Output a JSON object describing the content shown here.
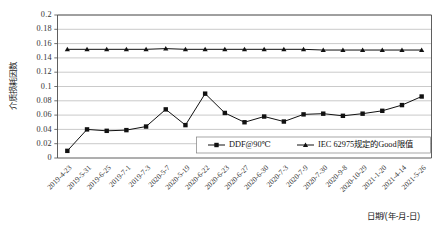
{
  "chart_data": {
    "type": "line",
    "title": "",
    "xlabel": "日期/(年-月-日)",
    "ylabel": "介质损耗因数",
    "ylim": [
      0,
      0.2
    ],
    "ytick_step": 0.02,
    "grid": true,
    "legend_position": "inside-bottom-right",
    "ytick_labels": [
      "0",
      "0.02",
      "0.04",
      "0.06",
      "0.08",
      "0.1",
      "0.12",
      "0.14",
      "0.16",
      "0.18",
      "0.2"
    ],
    "ytick_values": [
      0,
      0.02,
      0.04,
      0.06,
      0.08,
      0.1,
      0.12,
      0.14,
      0.16,
      0.18,
      0.2
    ],
    "categories": [
      "2019-4-23",
      "2019-5-31",
      "2019-6-25",
      "2019-7-1",
      "2019-7-3",
      "2020-5-7",
      "2020-5-19",
      "2020-6-22",
      "2020-6-23",
      "2020-6-27",
      "2020-6-30",
      "2020-7-3",
      "2020-7-9",
      "2020-7-30",
      "2020-9-8",
      "2020-10-29",
      "2021-1-20",
      "2021-4-14",
      "2021-5-26"
    ],
    "series": [
      {
        "name": "DDF@90℃",
        "marker": "square",
        "color": "#111111",
        "values": [
          0.01,
          0.04,
          0.038,
          0.039,
          0.044,
          0.068,
          0.046,
          0.09,
          0.063,
          0.05,
          0.058,
          0.051,
          0.061,
          0.062,
          0.059,
          0.062,
          0.066,
          0.074,
          0.086
        ]
      },
      {
        "name": "IEC 62975规定的Good限值",
        "marker": "triangle",
        "color": "#111111",
        "values": [
          0.152,
          0.152,
          0.152,
          0.152,
          0.152,
          0.153,
          0.152,
          0.152,
          0.152,
          0.152,
          0.152,
          0.152,
          0.152,
          0.151,
          0.151,
          0.151,
          0.151,
          0.151,
          0.151
        ]
      }
    ]
  }
}
